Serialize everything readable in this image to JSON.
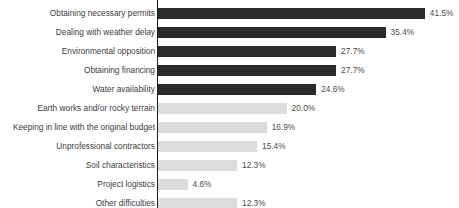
{
  "chart_data": {
    "type": "bar",
    "orientation": "horizontal",
    "title": "",
    "xlabel": "",
    "ylabel": "",
    "xlim": [
      0,
      41.5
    ],
    "grid": false,
    "legend": null,
    "value_suffix": "%",
    "categories": [
      "Obtaining necessary permits",
      "Dealing with weather delay",
      "Environmental opposition",
      "Obtaining financing",
      "Water availability",
      "Earth works and/or rocky terrain",
      "Keeping in line with the original budget",
      "Unprofessional contractors",
      "Soil characteristics",
      "Project logistics",
      "Other difficulties"
    ],
    "values": [
      41.5,
      35.4,
      27.7,
      27.7,
      24.6,
      20.0,
      16.9,
      15.4,
      12.3,
      4.6,
      12.3
    ],
    "value_labels": [
      "41.5%",
      "35.4%",
      "27.7%",
      "27.7%",
      "24.6%",
      "20.0%",
      "16.9%",
      "15.4%",
      "12.3%",
      "4.6%",
      "12.3%"
    ],
    "bar_styles": [
      "dark",
      "dark",
      "dark",
      "dark",
      "dark",
      "light",
      "light",
      "light",
      "light",
      "light",
      "light"
    ],
    "colors": {
      "dark_bar": "#2b2b2b",
      "light_bar": "#dcdcdc",
      "axis": "#1d1d1d",
      "label_text": "#3c3c3c",
      "value_text": "#4a4a4a",
      "background": "#ffffff"
    }
  }
}
